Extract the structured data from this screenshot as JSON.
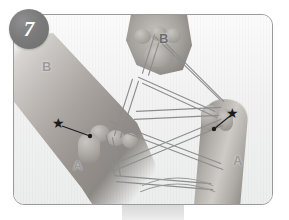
{
  "figure": {
    "type": "instructional-photograph",
    "color_mode": "grayscale"
  },
  "step_badge": {
    "number": "7",
    "shape": "circle",
    "fill_color": "#7b7b7b",
    "text_color": "#ffffff"
  },
  "frame": {
    "border_color": "#9b9b9b",
    "corner_radius_px": 11,
    "background_color": "#f4f4f4"
  },
  "labels": [
    {
      "text": "B",
      "position": "upper-left",
      "color": "#9a9a9a"
    },
    {
      "text": "B",
      "position": "upper-center-right",
      "color": "#6d6d6d"
    },
    {
      "text": "A",
      "position": "lower-left",
      "color": "#9a9a9a"
    },
    {
      "text": "A",
      "position": "lower-right",
      "color": "#9a9a9a"
    }
  ],
  "markers": [
    {
      "name": "star-marker-left",
      "glyph": "★",
      "color": "#1c1c1c",
      "points_to": "left-thumb-string-loop"
    },
    {
      "name": "star-marker-right",
      "glyph": "★",
      "color": "#1c1c1c",
      "points_to": "right-thumb-string-loop"
    }
  ],
  "string": {
    "color": "#8d8d8d",
    "description": "looped cord crossing between both hands forming an X pattern"
  }
}
